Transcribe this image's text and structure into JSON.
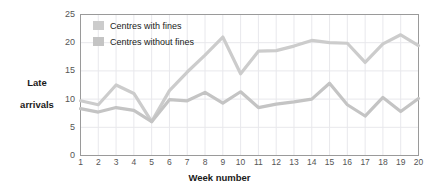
{
  "chart_data": {
    "type": "line",
    "title": "",
    "xlabel": "Week number",
    "ylabel": "Late\narrivals",
    "x": [
      1,
      2,
      3,
      4,
      5,
      6,
      7,
      8,
      9,
      10,
      11,
      12,
      13,
      14,
      15,
      16,
      17,
      18,
      19,
      20
    ],
    "xticklabels": [
      "1",
      "2",
      "3",
      "4",
      "5",
      "6",
      "7",
      "8",
      "9",
      "10",
      "11",
      "12",
      "13",
      "14",
      "15",
      "16",
      "17",
      "18",
      "19",
      "20"
    ],
    "yticklabels": [
      "0",
      "5",
      "10",
      "15",
      "20",
      "25"
    ],
    "yticks": [
      0,
      5,
      10,
      15,
      20,
      25
    ],
    "ylim": [
      0,
      25
    ],
    "xlim": [
      1,
      20
    ],
    "grid": true,
    "legend_position": "top-left-inside",
    "series": [
      {
        "name": "Centres with fines",
        "color": "#cccccc",
        "values": [
          9.7,
          9.0,
          12.5,
          11.0,
          6.0,
          11.5,
          14.8,
          17.8,
          21.0,
          14.5,
          18.5,
          18.6,
          19.4,
          20.4,
          20.0,
          19.9,
          16.5,
          19.8,
          21.4,
          19.5
        ]
      },
      {
        "name": "Centres without fines",
        "color": "#c4c4c4",
        "values": [
          8.3,
          7.7,
          8.5,
          8.0,
          6.0,
          9.9,
          9.7,
          11.2,
          9.3,
          11.3,
          8.5,
          9.1,
          9.5,
          10.0,
          12.8,
          9.0,
          7.0,
          10.3,
          7.8,
          10.1
        ]
      }
    ]
  },
  "legend": {
    "items": [
      {
        "label": "Centres with fines"
      },
      {
        "label": "Centres without fines"
      }
    ]
  },
  "axes": {
    "x_title": "Week number",
    "y_title_line1": "Late",
    "y_title_line2": "arrivals"
  },
  "colors": {
    "series_with_fines": "#cccccc",
    "series_without_fines": "#c4c4c4",
    "grid": "#e8e8ec",
    "frame": "#9a9a9a",
    "tick_text": "#555555",
    "title_text": "#1a1a1a",
    "background": "#ffffff"
  }
}
